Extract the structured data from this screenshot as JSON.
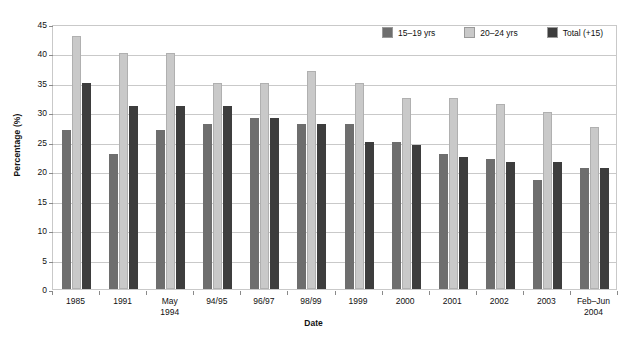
{
  "chart_data": {
    "type": "bar",
    "title": "",
    "xlabel": "Date",
    "ylabel": "Percentage (%)",
    "ylim": [
      0,
      45
    ],
    "ytick_step": 5,
    "yticks": [
      0,
      5,
      10,
      15,
      20,
      25,
      30,
      35,
      40,
      45
    ],
    "grid": true,
    "legend_position": "top-right",
    "categories": [
      "1985",
      "1991",
      "May\n1994",
      "94/95",
      "96/97",
      "98/99",
      "1999",
      "2000",
      "2001",
      "2002",
      "2003",
      "Feb–Jun\n2004"
    ],
    "series": [
      {
        "name": "15–19 yrs",
        "color": "#6e6e6e",
        "values": [
          27,
          23,
          27,
          28,
          29,
          28,
          28,
          25,
          23,
          22,
          18.5,
          20.5
        ]
      },
      {
        "name": "20–24 yrs",
        "color": "#c9c9c9",
        "values": [
          43,
          40,
          40,
          35,
          35,
          37,
          35,
          32.5,
          32.5,
          31.5,
          30,
          27.5
        ]
      },
      {
        "name": "Total (+15)",
        "color": "#3d3d3d",
        "values": [
          35,
          31,
          31,
          31,
          29,
          28,
          25,
          24.5,
          22.5,
          21.5,
          21.5,
          20.5
        ]
      }
    ]
  },
  "axes": {
    "y_title": "Percentage (%)",
    "x_title": "Date",
    "y_tick_labels": [
      "0",
      "5",
      "10",
      "15",
      "20",
      "25",
      "30",
      "35",
      "40",
      "45"
    ],
    "x_tick_labels": [
      "1985",
      "1991",
      "May\n1994",
      "94/95",
      "96/97",
      "98/99",
      "1999",
      "2000",
      "2001",
      "2002",
      "2003",
      "Feb–Jun\n2004"
    ]
  },
  "legend": {
    "items": [
      {
        "label": "15–19 yrs",
        "color": "#6e6e6e"
      },
      {
        "label": "20–24 yrs",
        "color": "#c9c9c9"
      },
      {
        "label": "Total (+15)",
        "color": "#3d3d3d"
      }
    ]
  },
  "colors": {
    "series_15_19": "#6e6e6e",
    "series_20_24": "#c9c9c9",
    "series_total": "#3d3d3d",
    "gridline": "#c9c9c9",
    "frame": "#c9c9c9",
    "background": "#ffffff",
    "text": "#111111"
  }
}
